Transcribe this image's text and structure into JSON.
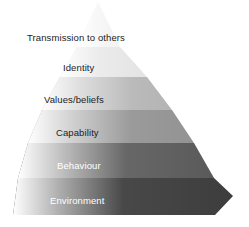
{
  "diagram": {
    "type": "stepped-pyramid",
    "orientation": "apex-top",
    "level_count": 6,
    "background_color": "#ffffff",
    "levels": [
      {
        "index": 1,
        "label": "Transmission to others",
        "fill": "#f2f2f2",
        "label_color": "#1c1c1c",
        "label_x": 27,
        "label_y": 33,
        "top_y": 2,
        "bottom_y": 47,
        "left_x": 77,
        "right_x": 120
      },
      {
        "index": 2,
        "label": "Identity",
        "fill": "#e3e3e3",
        "label_color": "#1c1c1c",
        "label_x": 63,
        "label_y": 63,
        "top_y": 47,
        "bottom_y": 77,
        "left_x": 60,
        "right_x": 147
      },
      {
        "index": 3,
        "label": "Values/beliefs",
        "fill": "#b4b4b4",
        "label_color": "#1c1c1c",
        "label_x": 44,
        "label_y": 95,
        "top_y": 77,
        "bottom_y": 110,
        "left_x": 42,
        "right_x": 172
      },
      {
        "index": 4,
        "label": "Capability",
        "fill": "#939393",
        "label_color": "#1c1c1c",
        "label_x": 56,
        "label_y": 128,
        "top_y": 110,
        "bottom_y": 143,
        "left_x": 28,
        "right_x": 194
      },
      {
        "index": 5,
        "label": "Behaviour",
        "fill": "#5a5a5a",
        "label_color": "#ffffff",
        "label_x": 57,
        "label_y": 161,
        "top_y": 143,
        "bottom_y": 178,
        "left_x": 18,
        "right_x": 214
      },
      {
        "index": 6,
        "label": "Environment",
        "fill": "#3d3d3d",
        "label_color": "#ffffff",
        "label_x": 50,
        "label_y": 196,
        "top_y": 178,
        "bottom_y": 215,
        "left_x": 10,
        "right_x": 233
      }
    ]
  }
}
